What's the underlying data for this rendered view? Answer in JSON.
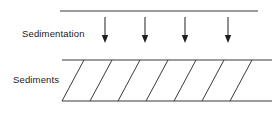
{
  "figure": {
    "name": "sedimentation-diagram",
    "width": 279,
    "height": 114,
    "background_color": "#ffffff",
    "line_color": "#3a3a3a",
    "hatch_color": "#2e2e2e",
    "arrow_color": "#1f1f1f",
    "text_color": "#1a1a1a"
  },
  "labels": {
    "sedimentation": "Sedimentation",
    "sediments": "Sediments"
  },
  "label_positions": {
    "sedimentation": {
      "x": 22,
      "y": 37
    },
    "sediments": {
      "x": 13,
      "y": 83
    }
  },
  "water_surface_line": {
    "name": "water-surface-line",
    "x1": 60,
    "y1": 11,
    "x2": 258,
    "y2": 11
  },
  "arrows": {
    "count": 4,
    "shaft_top_y": 17,
    "shaft_bottom_y": 36,
    "tip_y": 43,
    "head_half_width": 3.2,
    "x_positions": [
      105,
      145,
      185,
      228
    ]
  },
  "sediment_band": {
    "name": "sediment-band",
    "left_x": 62,
    "right_x": 272,
    "top_y": 60,
    "bottom_y": 101,
    "hatch_offset_x": 22,
    "hatch_count": 7,
    "hatch_top_x": [
      84,
      112,
      140,
      168,
      196,
      224,
      252
    ]
  }
}
